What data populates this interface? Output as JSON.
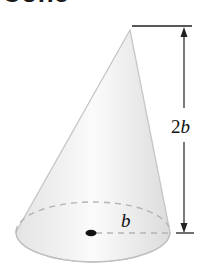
{
  "title": "Cone",
  "figure": {
    "shape": "cone",
    "height_label_coef": "2",
    "height_label_var": "b",
    "radius_label": "b",
    "colors": {
      "surface_light": "#f4f4f4",
      "surface_mid": "#e2e2e2",
      "edge": "#c4c4c4",
      "dash": "#b0b0b0",
      "line": "#222222"
    }
  }
}
